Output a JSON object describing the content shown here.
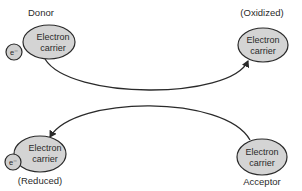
{
  "diagram": {
    "type": "electron-transfer",
    "colors": {
      "carrier_fill": "#d4d4d4",
      "electron_fill": "#d0d0d0",
      "stroke": "#2a2a2a",
      "background": "#ffffff"
    },
    "nodes": [
      {
        "id": "donor",
        "label": "Donor",
        "carrier_text_line1": "Electron",
        "carrier_text_line2": "carrier",
        "has_electron": true,
        "electron_label": "e⁻"
      },
      {
        "id": "oxidized",
        "label": "(Oxidized)",
        "carrier_text_line1": "Electron",
        "carrier_text_line2": "carrier",
        "has_electron": false
      },
      {
        "id": "reduced",
        "label": "(Reduced)",
        "carrier_text_line1": "Electron",
        "carrier_text_line2": "carrier",
        "has_electron": true,
        "electron_label": "e⁻"
      },
      {
        "id": "acceptor",
        "label": "Acceptor",
        "carrier_text_line1": "Electron",
        "carrier_text_line2": "carrier",
        "has_electron": false
      }
    ],
    "edges": [
      {
        "from": "donor",
        "to": "oxidized",
        "arrowhead": "end"
      },
      {
        "from": "acceptor",
        "to": "reduced",
        "arrowhead": "end"
      }
    ]
  }
}
